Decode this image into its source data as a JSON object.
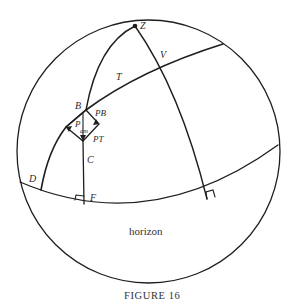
{
  "figure": {
    "caption": "FIGURE 16",
    "horizon_label": "horizon",
    "points": {
      "zenith": "Z",
      "v": "V",
      "t": "T",
      "b": "B",
      "c": "C",
      "d": "D",
      "f": "F"
    },
    "vectors": {
      "pb": "PB",
      "pt": "PT",
      "pam_main": "P",
      "pam_sub": "am"
    },
    "stroke_color": "#1e1e1e"
  }
}
